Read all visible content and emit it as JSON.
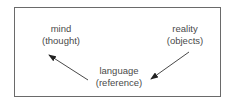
{
  "diagram": {
    "nodes": [
      {
        "id": "mind",
        "line1": "mind",
        "line2": "(thought)"
      },
      {
        "id": "reality",
        "line1": "reality",
        "line2": "(objects)"
      },
      {
        "id": "language",
        "line1": "language",
        "line2": "(reference)"
      }
    ],
    "edges": [
      {
        "from": "language",
        "to": "mind"
      },
      {
        "from": "reality",
        "to": "language"
      }
    ],
    "colors": {
      "text": "#4a4a4a",
      "border": "#6a6a6a",
      "arrow": "#333333"
    }
  }
}
